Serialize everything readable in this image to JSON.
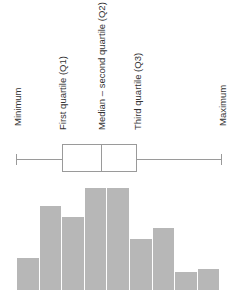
{
  "labels": {
    "minimum": "Minimum",
    "q1": "First quartile (Q1)",
    "median": "Median – second quartile (Q2)",
    "q3": "Third quartile (Q3)",
    "maximum": "Maximum"
  },
  "colors": {
    "bar": "#b7b7b7",
    "box_line": "#9a9a9a",
    "text": "#333333"
  },
  "chart_data": {
    "type": "bar",
    "title": "",
    "boxplot": {
      "minimum_x": 16,
      "q1_x": 62,
      "median_x": 101,
      "q3_x": 136,
      "maximum_x": 221,
      "labels": [
        "Minimum",
        "First quartile (Q1)",
        "Median – second quartile (Q2)",
        "Third quartile (Q3)",
        "Maximum"
      ]
    },
    "histogram": {
      "categories": [
        "1",
        "2",
        "3",
        "4",
        "5",
        "6",
        "7",
        "8",
        "9"
      ],
      "values": [
        32,
        84,
        73,
        102,
        102,
        51,
        62,
        18,
        21
      ]
    },
    "xlabel": "",
    "ylabel": "",
    "grid": false,
    "legend": "none"
  }
}
